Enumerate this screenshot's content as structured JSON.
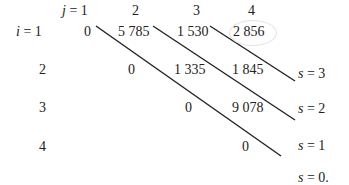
{
  "table": {
    "col_header_var": "j",
    "row_header_var": "i",
    "col_headers": [
      "1",
      "2",
      "3",
      "4"
    ],
    "row_headers": [
      "1",
      "2",
      "3",
      "4"
    ],
    "rows": [
      [
        "0",
        "5 785",
        "1 530",
        "2 856"
      ],
      [
        "",
        "0",
        "1 335",
        "1 845"
      ],
      [
        "",
        "",
        "0",
        "9 078"
      ],
      [
        "",
        "",
        "",
        "0"
      ]
    ],
    "highlighted_cell": "2 856"
  },
  "diagonal_labels": [
    {
      "var": "s",
      "value": "3",
      "suffix": ""
    },
    {
      "var": "s",
      "value": "2",
      "suffix": ""
    },
    {
      "var": "s",
      "value": "1",
      "suffix": ""
    },
    {
      "var": "s",
      "value": "0",
      "suffix": "."
    }
  ],
  "colors": {
    "text": "#222222",
    "lines": "#222222",
    "ellipse": "#e4e4e4"
  }
}
